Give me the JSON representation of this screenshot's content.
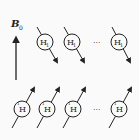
{
  "field": {
    "label": "B",
    "subscript": "0",
    "direction": "up"
  },
  "top_row": {
    "description": "spins anti-parallel to field",
    "nucleus_label": "H",
    "label_sub": "1",
    "ellipsis": "···",
    "spin_direction": "down-right",
    "count_visible": 3
  },
  "bottom_row": {
    "description": "spins parallel to field",
    "nucleus_label": "H",
    "label_sup": "1",
    "ellipsis": "···",
    "spin_direction": "up-right",
    "count_visible": 4
  },
  "colors": {
    "ink": "#222222",
    "background": "#fafafa"
  }
}
